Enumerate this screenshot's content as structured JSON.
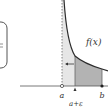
{
  "diagram": {
    "type": "improper-integral-illustration",
    "labels": {
      "function": "f(x)",
      "lower_limit": "a",
      "shifted_limit": "a+ε",
      "upper_limit": "b"
    },
    "colors": {
      "curve": "#2b2b2b",
      "axis": "#555555",
      "light_region": "#e6e6e6",
      "dark_region": "#b3b3b3",
      "box_border": "#555555"
    },
    "annotations": {
      "arrow_direction": "left",
      "asymptote_style": "dotted",
      "endpoint_a": "open",
      "endpoint_b": "closed"
    }
  }
}
